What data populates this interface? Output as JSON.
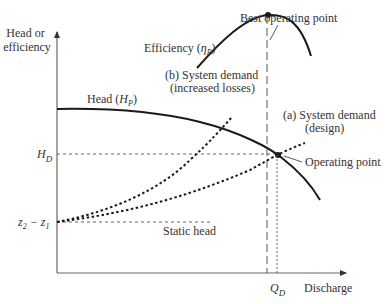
{
  "diagram": {
    "type": "pump-system operating curve",
    "axes": {
      "y_label_line1": "Head or",
      "y_label_line2": "efficiency",
      "x_label": "Discharge"
    },
    "y_ticks": {
      "hd_main": "H",
      "hd_sub": "D",
      "static_main": "z",
      "static_sub1": "2",
      "static_minus": " − z",
      "static_sub2": "1"
    },
    "x_ticks": {
      "qd_main": "Q",
      "qd_sub": "D"
    },
    "curves": {
      "head": {
        "prefix": "Head (",
        "symbol": "H",
        "sub": "P",
        "suffix": ")"
      },
      "efficiency": {
        "prefix": "Efficiency (",
        "symbol": "η",
        "sub": "P",
        "suffix": ")"
      },
      "system_b_line1": "(b) System demand",
      "system_b_line2": "(increased losses)",
      "system_a_line1": "(a) System demand",
      "system_a_line2": "(design)",
      "static_head": "Static head"
    },
    "annotations": {
      "best_operating_point": "Best operating point",
      "operating_point": "Operating point"
    },
    "colors": {
      "line": "#1a1a1a",
      "axis": "#555555",
      "text": "#333333"
    }
  }
}
